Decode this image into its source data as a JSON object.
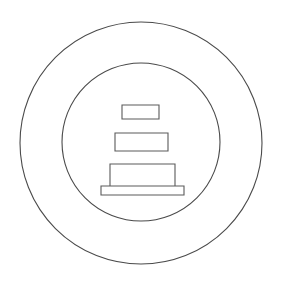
{
  "image": {
    "title": "Monument / Pagoda Line Icon",
    "description": "Black-and-white line drawing of a stepped three-tier structure on a plinth, centered inside two concentric circles",
    "style": "outline-line-art",
    "background_color": "#ffffff",
    "stroke_color": "#4a4a4a",
    "fill_color": "#ffffff",
    "canvas": {
      "width": 281,
      "height": 285
    }
  },
  "shapes": {
    "outer_circle": {
      "name": "outer-circle",
      "cx": 141,
      "cy": 143,
      "r": 121,
      "stroke": "#4a4a4a",
      "fill": "none"
    },
    "inner_circle": {
      "name": "inner-circle",
      "cx": 141,
      "cy": 142,
      "r": 79,
      "stroke": "#4a4a4a",
      "fill": "none"
    },
    "tiers": [
      {
        "name": "tier-top",
        "label": "top tier",
        "x": 122,
        "y": 105,
        "width": 37,
        "height": 14
      },
      {
        "name": "tier-middle",
        "label": "middle tier",
        "x": 115,
        "y": 133,
        "width": 53,
        "height": 18
      },
      {
        "name": "tier-bottom",
        "label": "bottom tier",
        "x": 110,
        "y": 164,
        "width": 65,
        "height": 23
      },
      {
        "name": "base-plinth",
        "label": "base plinth",
        "x": 101,
        "y": 186,
        "width": 83,
        "height": 9
      }
    ]
  }
}
